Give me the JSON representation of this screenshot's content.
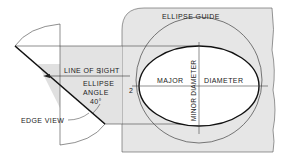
{
  "diagram": {
    "title": "ELLIPSE GUIDE",
    "labels": {
      "line_of_sight": "LINE OF SIGHT",
      "ellipse": "ELLIPSE",
      "angle": "ANGLE",
      "angle_value": "40°",
      "edge_view": "EDGE VIEW",
      "major": "MAJOR",
      "diameter": "DIAMETER",
      "minor_diameter": "MINOR DIAMETER",
      "index_number": "2"
    },
    "colors": {
      "card_fill": "#e6e6e6",
      "shade_fill": "#e0e0e0",
      "line": "#333333",
      "bold_line": "#111111",
      "background": "#ffffff"
    }
  }
}
